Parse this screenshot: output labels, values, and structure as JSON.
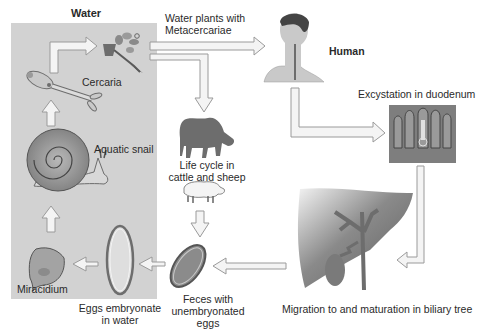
{
  "regions": {
    "water": {
      "label": "Water",
      "fill": "#d2d2d2"
    }
  },
  "stages": {
    "metacercariae": {
      "label_line1": "Water plants with",
      "label_line2": "Metacercariae"
    },
    "human": {
      "label": "Human"
    },
    "excystation": {
      "label": "Excystation in duodenum"
    },
    "cattle": {
      "label_line1": "Life cycle in",
      "label_line2": "cattle and sheep"
    },
    "migration": {
      "label": "Migration to and maturation in biliary tree"
    },
    "feces": {
      "label_line1": "Feces with",
      "label_line2": "unembryonated",
      "label_line3": "eggs"
    },
    "eggs_water": {
      "label_line1": "Eggs embryonate",
      "label_line2": "in water"
    },
    "miracidium": {
      "label": "Miracidium"
    },
    "snail": {
      "label": "Aquatic snail"
    },
    "cercaria": {
      "label": "Cercaria"
    }
  },
  "colors": {
    "arrow_fill": "#f4f4f4",
    "arrow_stroke": "#9a9a9a",
    "organism_dark": "#6d6d6d",
    "organism_mid": "#9b9b9b"
  }
}
